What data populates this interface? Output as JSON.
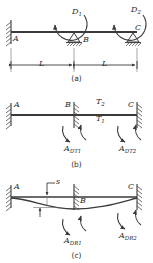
{
  "figure": {
    "line_color": "#3a3a3a",
    "hatch_color": "#4a4a4a"
  },
  "panel_a": {
    "caption": "(a)",
    "joints": [
      {
        "name": "node-a",
        "label": "A",
        "support": "fixed-wall"
      },
      {
        "name": "node-b",
        "label": "B",
        "support": "pin-triangle"
      },
      {
        "name": "node-c",
        "label": "C",
        "support": "pin-triangle"
      }
    ],
    "moments": [
      {
        "name": "moment-d1",
        "label": "D",
        "sub": "1"
      },
      {
        "name": "moment-d2",
        "label": "D",
        "sub": "2"
      }
    ],
    "dimensions": [
      {
        "name": "span-ab",
        "label": "L"
      },
      {
        "name": "span-bc",
        "label": "L"
      }
    ]
  },
  "panel_b": {
    "caption": "(b)",
    "joints": [
      {
        "name": "node-a",
        "label": "A",
        "support": "fixed-wall"
      },
      {
        "name": "node-b",
        "label": "B",
        "support": "restraint-wall"
      },
      {
        "name": "node-c",
        "label": "C",
        "support": "restraint-wall"
      }
    ],
    "loads": [
      {
        "name": "torque-t2",
        "label": "T",
        "sub": "2"
      },
      {
        "name": "torque-t1",
        "label": "T",
        "sub": "1"
      }
    ],
    "reactions": [
      {
        "name": "reaction-adt1",
        "label": "A",
        "sub": "DT1"
      },
      {
        "name": "reaction-adt2",
        "label": "A",
        "sub": "DT2"
      }
    ]
  },
  "panel_c": {
    "caption": "(c)",
    "joints": [
      {
        "name": "node-a",
        "label": "A",
        "support": "fixed-wall"
      },
      {
        "name": "node-b",
        "label": "B",
        "support": "restraint-wall"
      },
      {
        "name": "node-c",
        "label": "C",
        "support": "restraint-wall"
      }
    ],
    "displacement": {
      "name": "displacement-s",
      "label": "s"
    },
    "reactions": [
      {
        "name": "reaction-adr1",
        "label": "A",
        "sub": "DR1"
      },
      {
        "name": "reaction-adr2",
        "label": "A",
        "sub": "DR2"
      }
    ]
  }
}
